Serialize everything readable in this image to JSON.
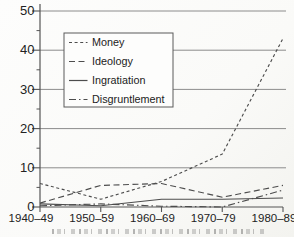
{
  "figure": {
    "kind": "scanned line chart",
    "background": "#fbfbf9",
    "line_color": "#4d4d4d",
    "grid_color": "#8c8c8c",
    "axis_color": "#555555",
    "text_color": "#222222",
    "legend_border_color": "#5a5a5a",
    "caption_visible_text": ""
  },
  "chart_data": {
    "type": "line",
    "title": "",
    "xlabel": "",
    "ylabel": "",
    "categories": [
      "1940–49",
      "1950–59",
      "1960–69",
      "1970–79",
      "1980–89"
    ],
    "series": [
      {
        "name": "Money",
        "values": [
          6,
          2,
          6.5,
          13.5,
          43
        ],
        "line_style": "dashed",
        "dash": "3,2.6"
      },
      {
        "name": "Ideology",
        "values": [
          1,
          5.5,
          6,
          2.5,
          5.5
        ],
        "line_style": "long-dashed",
        "dash": "6,3.5"
      },
      {
        "name": "Ingratiation",
        "values": [
          0.8,
          0.3,
          2,
          2,
          2.3
        ],
        "line_style": "solid",
        "dash": ""
      },
      {
        "name": "Disgruntlement",
        "values": [
          0.3,
          0.8,
          0.2,
          0,
          4.3
        ],
        "line_style": "dash-dot",
        "dash": "7,3,1.5,3"
      }
    ],
    "y_ticks": [
      0,
      10,
      20,
      30,
      40,
      50
    ],
    "y_minor_ticks": [
      5,
      15,
      25,
      35,
      45
    ],
    "ylim": [
      0,
      50
    ],
    "grid": true,
    "legend": {
      "position": "upper-left-inside",
      "entries": [
        "Money",
        "Ideology",
        "Ingratiation",
        "Disgruntlement"
      ]
    }
  }
}
